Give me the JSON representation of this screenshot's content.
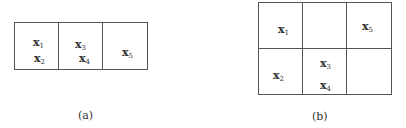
{
  "figures": [
    {
      "id": "a",
      "caption": "(a)",
      "layout": "1x3",
      "cells": [
        {
          "items": [
            {
              "base": "x",
              "sub": "1"
            },
            {
              "base": "x",
              "sub": "2"
            }
          ]
        },
        {
          "items": [
            {
              "base": "x",
              "sub": "3"
            },
            {
              "base": "x",
              "sub": "4"
            }
          ]
        },
        {
          "items": [
            {
              "base": "x",
              "sub": "5"
            }
          ]
        }
      ]
    },
    {
      "id": "b",
      "caption": "(b)",
      "layout": "2x3",
      "cells": [
        {
          "items": [
            {
              "base": "x",
              "sub": "1"
            }
          ]
        },
        {
          "items": []
        },
        {
          "items": [
            {
              "base": "x",
              "sub": "5"
            }
          ]
        },
        {
          "items": [
            {
              "base": "x",
              "sub": "2"
            }
          ]
        },
        {
          "items": [
            {
              "base": "x",
              "sub": "3"
            },
            {
              "base": "x",
              "sub": "4"
            }
          ]
        },
        {
          "items": []
        }
      ]
    }
  ]
}
